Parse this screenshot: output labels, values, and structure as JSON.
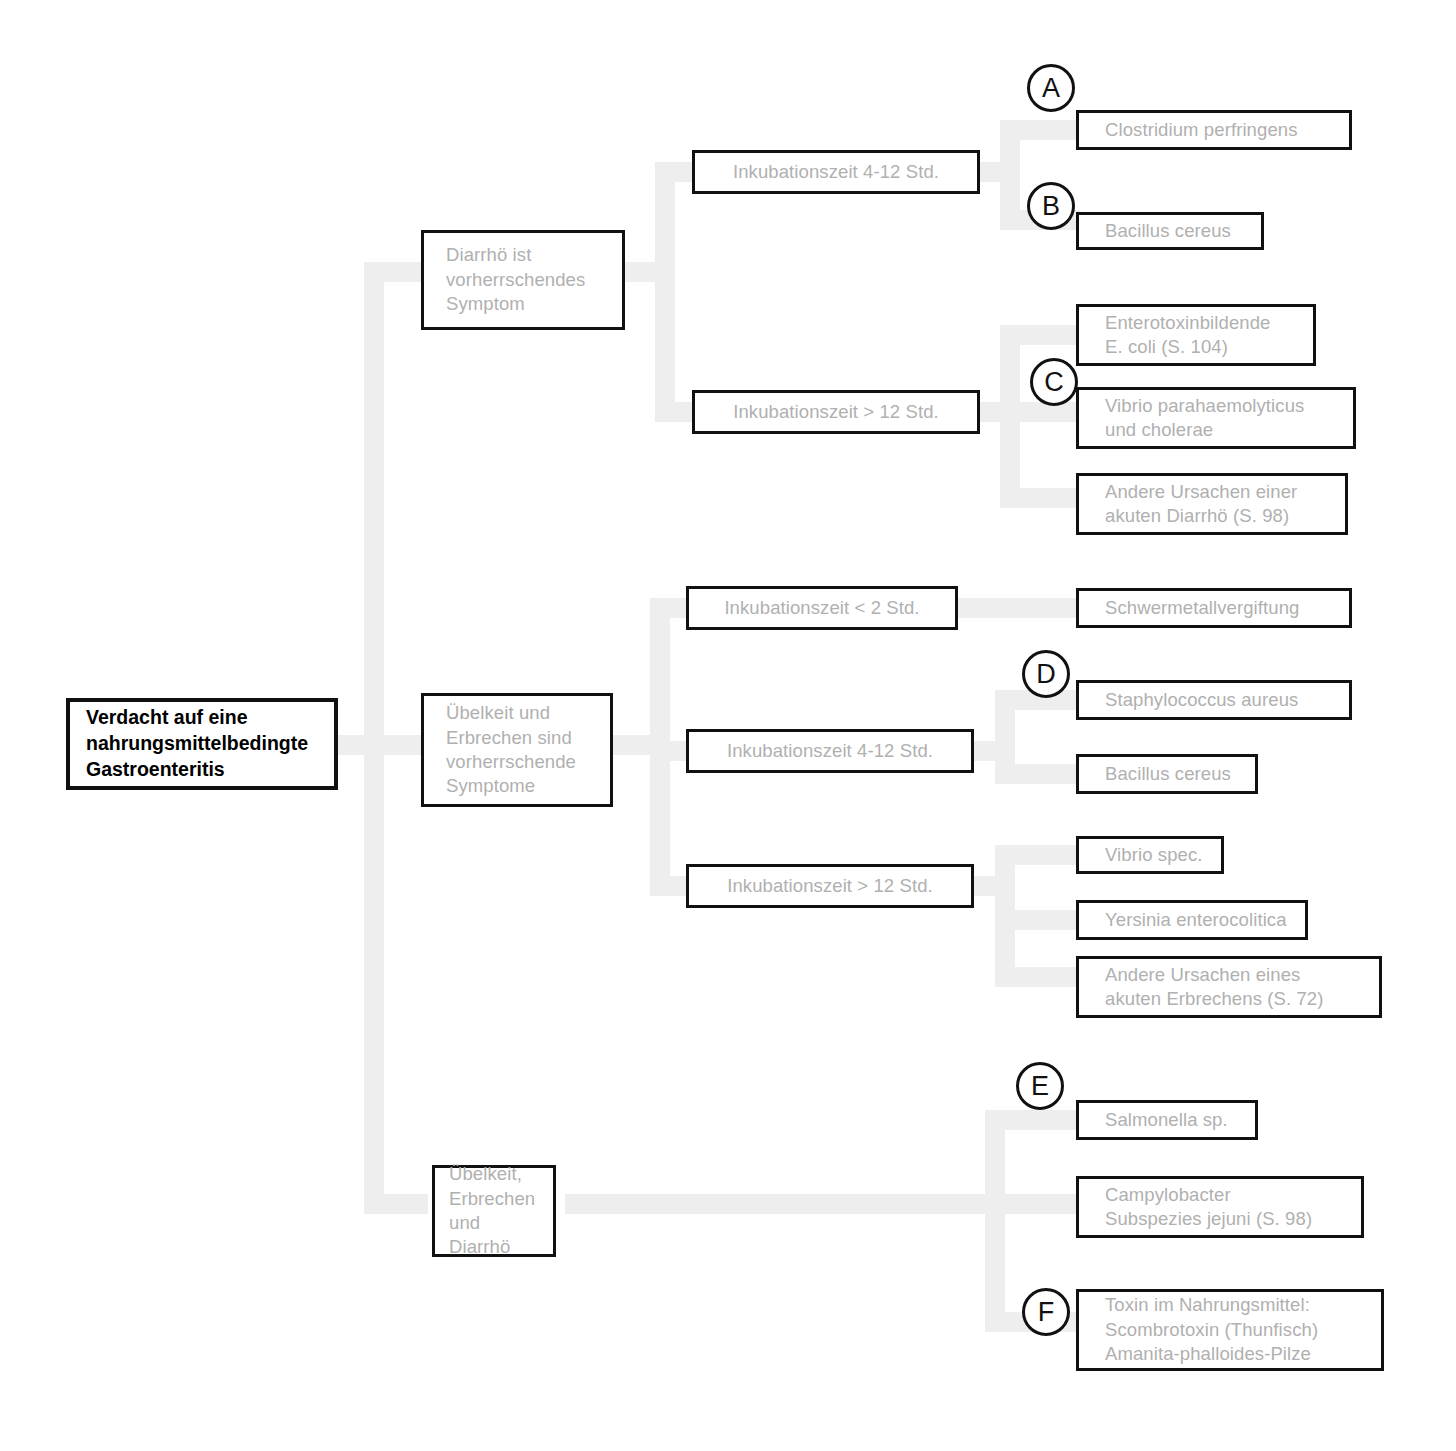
{
  "diagram": {
    "title": "Verdacht auf eine nahrungsmittelbedingte Gastroenteritis",
    "type": "decision-tree",
    "language": "de"
  },
  "root": {
    "label": "Verdacht auf eine\nnahrungsmittelbedingte\nGastroenteritis"
  },
  "branches": [
    {
      "id": "diarrhoe",
      "label": "Diarrhö ist\nvorherrschendes\nSymptom",
      "conditions": [
        {
          "id": "inkubation-4-12-a",
          "label": "Inkubationszeit 4-12 Std.",
          "outcomes": [
            {
              "tag": "A",
              "label": "Clostridium perfringens"
            },
            {
              "tag": "B",
              "label": "Bacillus cereus"
            }
          ]
        },
        {
          "id": "inkubation-gt-12-a",
          "label": "Inkubationszeit > 12 Std.",
          "outcomes": [
            {
              "tag": "",
              "label": "Enterotoxinbildende\nE. coli (S. 104)"
            },
            {
              "tag": "C",
              "label": "Vibrio parahaemolyticus\nund cholerae"
            },
            {
              "tag": "",
              "label": "Andere Ursachen einer\nakuten Diarrhö (S. 98)"
            }
          ]
        }
      ]
    },
    {
      "id": "uebelkeit-erbrechen",
      "label": "Übelkeit und\nErbrechen sind\nvorherrschende\nSymptome",
      "conditions": [
        {
          "id": "inkubation-lt-2",
          "label": "Inkubationszeit < 2 Std.",
          "outcomes": [
            {
              "tag": "",
              "label": "Schwermetallvergiftung"
            }
          ]
        },
        {
          "id": "inkubation-4-12-b",
          "label": "Inkubationszeit 4-12 Std.",
          "outcomes": [
            {
              "tag": "D",
              "label": "Staphylococcus aureus"
            },
            {
              "tag": "",
              "label": "Bacillus cereus"
            }
          ]
        },
        {
          "id": "inkubation-gt-12-b",
          "label": "Inkubationszeit > 12 Std.",
          "outcomes": [
            {
              "tag": "",
              "label": "Vibrio spec."
            },
            {
              "tag": "",
              "label": "Yersinia enterocolitica"
            },
            {
              "tag": "",
              "label": "Andere Ursachen eines\nakuten Erbrechens (S. 72)"
            }
          ]
        }
      ]
    },
    {
      "id": "uebelkeit-erbrechen-diarrhoe",
      "label": "Übelkeit,\nErbrechen\nund Diarrhö",
      "conditions": [
        {
          "id": "direct",
          "label": "",
          "outcomes": [
            {
              "tag": "E",
              "label": "Salmonella sp."
            },
            {
              "tag": "",
              "label": "Campylobacter\nSubspezies jejuni (S. 98)"
            },
            {
              "tag": "F",
              "label": "Toxin im Nahrungsmittel:\n  Scombrotoxin (Thunfisch)\n  Amanita-phalloides-Pilze"
            }
          ]
        }
      ]
    }
  ],
  "colors": {
    "connector": "#eeeeee",
    "box_border": "#111111",
    "box_text": "#b0b0b0",
    "root_text": "#000000",
    "background": "#ffffff"
  }
}
